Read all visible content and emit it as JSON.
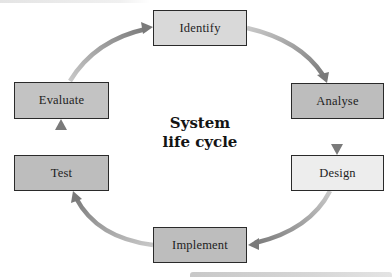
{
  "diagram": {
    "title_line1": "System",
    "title_line2": "life cycle",
    "stages": [
      {
        "id": "identify",
        "label": "Identify",
        "fill": "#d9d9d9"
      },
      {
        "id": "analyse",
        "label": "Analyse",
        "fill": "#bdbdbd"
      },
      {
        "id": "design",
        "label": "Design",
        "fill": "#ededed"
      },
      {
        "id": "implement",
        "label": "Implement",
        "fill": "#bdbdbd"
      },
      {
        "id": "test",
        "label": "Test",
        "fill": "#bdbdbd"
      },
      {
        "id": "evaluate",
        "label": "Evaluate",
        "fill": "#c3c3c3"
      }
    ],
    "flow": [
      {
        "from": "Identify",
        "to": "Analyse"
      },
      {
        "from": "Analyse",
        "to": "Design"
      },
      {
        "from": "Design",
        "to": "Implement"
      },
      {
        "from": "Implement",
        "to": "Test"
      },
      {
        "from": "Test",
        "to": "Evaluate"
      },
      {
        "from": "Evaluate",
        "to": "Identify"
      }
    ],
    "colors": {
      "border": "#2a2a2a",
      "arrow_dark": "#7a7a7a",
      "arrow_light": "#c4c4c4",
      "text": "#1e1e1e"
    }
  }
}
